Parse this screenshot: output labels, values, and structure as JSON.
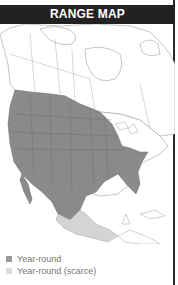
{
  "header": {
    "title": "RANGE MAP"
  },
  "colors": {
    "header_bg": "#222222",
    "year_round": "#8a8a8a",
    "year_round_scarce": "#d4d4d4",
    "land_outline": "#9a9a9a",
    "water": "#ffffff"
  },
  "legend": {
    "items": [
      {
        "label": "Year-round",
        "color": "#9a9a9a"
      },
      {
        "label": "Year-round (scarce)",
        "color": "#dddddd"
      }
    ]
  },
  "map": {
    "region": "North America"
  }
}
